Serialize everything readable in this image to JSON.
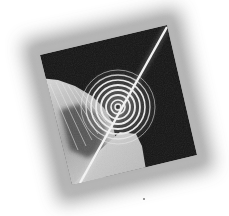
{
  "image": {
    "width": 229,
    "height": 216,
    "description": "Grayscale abstract artwork: tilted dark square with concentric ripple rings and a diagonal light streak, surrounded by soft blurred gray frame",
    "colors": {
      "background": "#ffffff",
      "frame_shadow": "#9a9a9a",
      "square_dark": "#141414",
      "light_wedge": "#c8c8c8",
      "streak": "#f2f2f2",
      "rings": "#e6e6e6"
    },
    "square_corners": [
      [
        40,
        55
      ],
      [
        167,
        25
      ],
      [
        197,
        155
      ],
      [
        72,
        185
      ]
    ],
    "ring_center": [
      118,
      107
    ],
    "streak_line": [
      [
        167,
        27
      ],
      [
        80,
        183
      ]
    ]
  }
}
